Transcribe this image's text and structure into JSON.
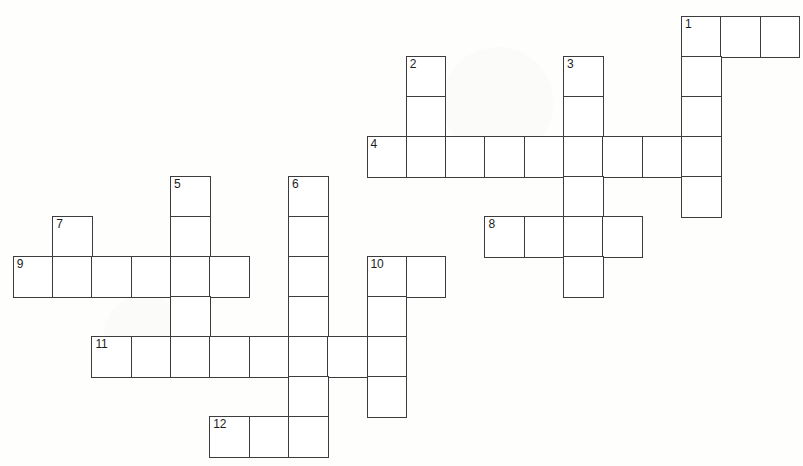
{
  "puzzle": {
    "title": "Crossword Grid",
    "cell_size": 39.3,
    "row_height": 40,
    "origin_x": 13.5,
    "origin_y": 17,
    "ink_color": "#3c3c3c",
    "cell_fill": "#ffffff",
    "page_background": "#fefefd",
    "number_color": "#1c1c1c",
    "entries": [
      {
        "number": "1",
        "direction": "across",
        "row": 0,
        "col": 17,
        "length": 3
      },
      {
        "number": "1",
        "direction": "down",
        "row": 0,
        "col": 17,
        "length": 5
      },
      {
        "number": "2",
        "direction": "down",
        "row": 1,
        "col": 10,
        "length": 3
      },
      {
        "number": "3",
        "direction": "down",
        "row": 1,
        "col": 14,
        "length": 6
      },
      {
        "number": "4",
        "direction": "across",
        "row": 3,
        "col": 9,
        "length": 9
      },
      {
        "number": "5",
        "direction": "down",
        "row": 4,
        "col": 4,
        "length": 5
      },
      {
        "number": "6",
        "direction": "down",
        "row": 4,
        "col": 7,
        "length": 7
      },
      {
        "number": "7",
        "direction": "down",
        "row": 5,
        "col": 1,
        "length": 2
      },
      {
        "number": "8",
        "direction": "across",
        "row": 5,
        "col": 12,
        "length": 4
      },
      {
        "number": "9",
        "direction": "across",
        "row": 6,
        "col": 0,
        "length": 6
      },
      {
        "number": "10",
        "direction": "across",
        "row": 6,
        "col": 9,
        "length": 2
      },
      {
        "number": "10",
        "direction": "down",
        "row": 6,
        "col": 9,
        "length": 4
      },
      {
        "number": "11",
        "direction": "across",
        "row": 8,
        "col": 2,
        "length": 8
      },
      {
        "number": "12",
        "direction": "across",
        "row": 10,
        "col": 5,
        "length": 3
      }
    ],
    "numbered_cells": [
      {
        "label": "1",
        "row": 0,
        "col": 17
      },
      {
        "label": "2",
        "row": 1,
        "col": 10
      },
      {
        "label": "3",
        "row": 1,
        "col": 14
      },
      {
        "label": "4",
        "row": 3,
        "col": 9
      },
      {
        "label": "5",
        "row": 4,
        "col": 4
      },
      {
        "label": "6",
        "row": 4,
        "col": 7
      },
      {
        "label": "7",
        "row": 5,
        "col": 1
      },
      {
        "label": "8",
        "row": 5,
        "col": 12
      },
      {
        "label": "9",
        "row": 6,
        "col": 0
      },
      {
        "label": "10",
        "row": 6,
        "col": 9
      },
      {
        "label": "11",
        "row": 8,
        "col": 2
      },
      {
        "label": "12",
        "row": 10,
        "col": 5
      }
    ],
    "letters": []
  }
}
